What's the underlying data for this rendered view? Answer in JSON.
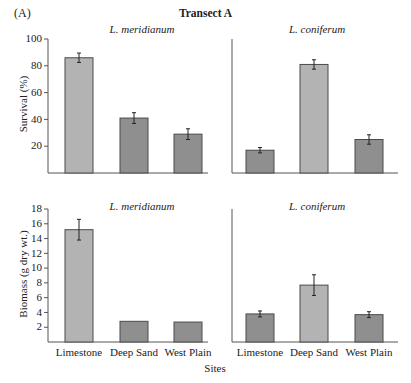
{
  "figure": {
    "panel_label": "(A)",
    "title": "Transect A",
    "x_axis_title": "Sites",
    "colors": {
      "light_bar": "#b3b3b3",
      "dark_bar": "#8f8f8f",
      "outline": "#4a4a4a",
      "axis": "#555555"
    }
  },
  "chart_data": [
    {
      "type": "bar",
      "title": "L. meridianum",
      "ylabel": "Survival (%)",
      "xlabel": "",
      "ylim": [
        0,
        100
      ],
      "yticks": [
        20,
        40,
        60,
        80,
        100
      ],
      "categories": [
        "Limestone",
        "Deep Sand",
        "West Plain"
      ],
      "values": [
        86,
        41,
        29
      ],
      "errors": [
        3.5,
        4,
        4
      ],
      "bar_shade": [
        "light",
        "dark",
        "dark"
      ],
      "grid": false
    },
    {
      "type": "bar",
      "title": "L. coniferum",
      "ylabel": "Survival (%)",
      "xlabel": "",
      "ylim": [
        0,
        100
      ],
      "yticks": [],
      "categories": [
        "Limestone",
        "Deep Sand",
        "West Plain"
      ],
      "values": [
        17,
        81,
        25
      ],
      "errors": [
        2,
        3.5,
        3.5
      ],
      "bar_shade": [
        "dark",
        "light",
        "dark"
      ],
      "grid": false
    },
    {
      "type": "bar",
      "title": "L. meridianum",
      "ylabel": "Biomass (g dry wt.)",
      "xlabel": "Sites",
      "ylim": [
        0,
        18
      ],
      "yticks": [
        2,
        4,
        6,
        8,
        10,
        12,
        14,
        16,
        18
      ],
      "categories": [
        "Limestone",
        "Deep Sand",
        "West Plain"
      ],
      "values": [
        15.2,
        2.8,
        2.7
      ],
      "errors": [
        1.4,
        0,
        0
      ],
      "bar_shade": [
        "light",
        "dark",
        "dark"
      ],
      "grid": false
    },
    {
      "type": "bar",
      "title": "L. coniferum",
      "ylabel": "Biomass (g dry wt.)",
      "xlabel": "Sites",
      "ylim": [
        0,
        18
      ],
      "yticks": [],
      "categories": [
        "Limestone",
        "Deep Sand",
        "West Plain"
      ],
      "values": [
        3.8,
        7.7,
        3.7
      ],
      "errors": [
        0.4,
        1.4,
        0.4
      ],
      "bar_shade": [
        "dark",
        "light",
        "dark"
      ],
      "grid": false
    }
  ]
}
